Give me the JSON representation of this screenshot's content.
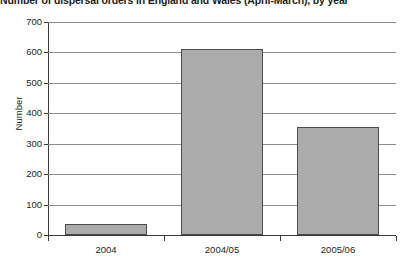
{
  "chart_data": {
    "type": "bar",
    "title": "Number of dispersal orders in England and Wales (April-March), by year",
    "xlabel": "",
    "ylabel": "Number",
    "categories": [
      "2004",
      "2004/05",
      "2005/06"
    ],
    "values": [
      35,
      610,
      355
    ],
    "ylim": [
      0,
      700
    ],
    "yticks": [
      0,
      100,
      200,
      300,
      400,
      500,
      600,
      700
    ],
    "ytick_labels": [
      "0",
      "100",
      "200",
      "300",
      "400",
      "500",
      "600",
      "700"
    ],
    "grid": "horizontal",
    "legend": "none",
    "bar_color": "#ababab",
    "bar_edge_color": "#4c4c4c",
    "axis_color": "#3a3a3a",
    "gridline_color": "#8d8d8d"
  }
}
